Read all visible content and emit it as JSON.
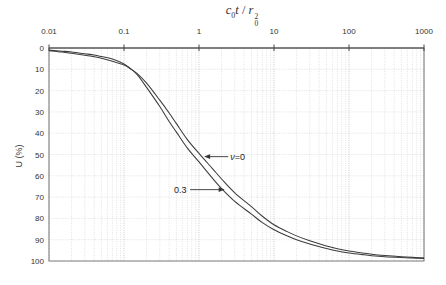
{
  "title": {
    "c": "c",
    "c_sub": "0",
    "t": "t",
    "sep": " / ",
    "r": "r",
    "r_sub": "0",
    "r_sup": "2",
    "plain": "c0t / r0^2"
  },
  "y_axis": {
    "label": "U (%)",
    "ticks": [
      "0",
      "10",
      "20",
      "30",
      "40",
      "50",
      "60",
      "70",
      "80",
      "90",
      "100"
    ],
    "tick_values": [
      0,
      10,
      20,
      30,
      40,
      50,
      60,
      70,
      80,
      90,
      100
    ]
  },
  "x_axis": {
    "ticks": [
      "0.01",
      "0.1",
      "1",
      "10",
      "100",
      "1000"
    ],
    "tick_values": [
      0.01,
      0.1,
      1,
      10,
      100,
      1000
    ],
    "scale": "log"
  },
  "colors": {
    "grid_minor": "#d7d7d7",
    "grid_major": "#c3c3c3",
    "frame": "#777777",
    "axis": "#444444",
    "curve": "#3c3c3c",
    "text": "#333333"
  },
  "chart_data": {
    "type": "line",
    "title": "",
    "xlabel": "c0t / r0^2 (log scale, top axis)",
    "ylabel": "U (%)",
    "xlim": [
      0.01,
      1000
    ],
    "ylim": [
      0,
      100
    ],
    "y_inverted": true,
    "grid": "on",
    "legend_position": "inline-arrows",
    "x": [
      0.01,
      0.015,
      0.02,
      0.03,
      0.04,
      0.05,
      0.07,
      0.1,
      0.12,
      0.15,
      0.2,
      0.3,
      0.4,
      0.5,
      0.7,
      1,
      1.5,
      2,
      3,
      5,
      7,
      10,
      15,
      20,
      30,
      50,
      70,
      100,
      150,
      200,
      300,
      500,
      700,
      1000
    ],
    "series": [
      {
        "name": "v=0",
        "values": [
          1.3,
          1.9,
          2.5,
          3.4,
          4.1,
          4.8,
          6.2,
          8.0,
          9.6,
          12.0,
          16.5,
          24.5,
          30.5,
          35.5,
          43.0,
          49.5,
          56.5,
          61.5,
          68.0,
          74.5,
          79.0,
          83.0,
          86.2,
          88.2,
          90.5,
          92.9,
          94.2,
          95.3,
          96.2,
          96.8,
          97.4,
          98.0,
          98.3,
          98.5
        ]
      },
      {
        "name": "v=0.3",
        "values": [
          1.0,
          1.5,
          1.9,
          2.7,
          3.3,
          4.0,
          5.2,
          7.5,
          9.5,
          12.5,
          18.5,
          27.5,
          34.5,
          39.5,
          47.0,
          53.5,
          61.0,
          66.0,
          72.0,
          78.0,
          82.0,
          85.3,
          88.2,
          90.0,
          92.0,
          94.1,
          95.3,
          96.2,
          97.0,
          97.5,
          98.0,
          98.4,
          98.6,
          98.8
        ]
      }
    ]
  },
  "annotations": [
    {
      "parts": [
        {
          "t": "ν",
          "i": true
        },
        {
          "t": "=0",
          "i": false
        }
      ],
      "anchor": "start",
      "tail": {
        "t": 2.45,
        "u": 51
      },
      "tip": {
        "t": 1.17,
        "u": 51
      },
      "label_at": {
        "t": 2.62,
        "u": 51
      }
    },
    {
      "parts": [
        {
          "t": "0.3",
          "i": false
        }
      ],
      "anchor": "end",
      "tail": {
        "t": 0.76,
        "u": 66.5
      },
      "tip": {
        "t": 2.2,
        "u": 66.5
      },
      "label_at": {
        "t": 0.68,
        "u": 66.5
      }
    }
  ]
}
